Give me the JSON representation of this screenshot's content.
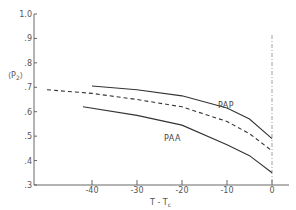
{
  "chart_data": {
    "type": "line",
    "title": "",
    "xlabel": "T - Tc",
    "ylabel": "⟨P2⟩",
    "xlim": [
      -50,
      3
    ],
    "ylim": [
      0.3,
      1.0
    ],
    "grid": false,
    "legend": "inline labels",
    "x_ticks": [
      "-40",
      "-30",
      "-20",
      "-10",
      "0"
    ],
    "y_ticks": [
      "1.0",
      ".9",
      ".8",
      ".7",
      ".6",
      ".5",
      ".4",
      ".3"
    ],
    "series": [
      {
        "name": "PAP",
        "style": "solid",
        "x": [
          -40,
          -30,
          -20,
          -10,
          -5,
          0
        ],
        "values": [
          0.705,
          0.69,
          0.665,
          0.615,
          0.57,
          0.49
        ]
      },
      {
        "name": "dashed",
        "style": "dashed",
        "x": [
          -50,
          -40,
          -30,
          -20,
          -10,
          -5,
          0
        ],
        "values": [
          0.69,
          0.675,
          0.65,
          0.62,
          0.56,
          0.51,
          0.44
        ]
      },
      {
        "name": "PAA",
        "style": "solid",
        "x": [
          -42,
          -30,
          -20,
          -10,
          -5,
          0
        ],
        "values": [
          0.62,
          0.585,
          0.545,
          0.465,
          0.42,
          0.35
        ]
      }
    ],
    "annotations": [
      {
        "type": "vertical dash-dot line",
        "x": 0
      }
    ]
  },
  "labels": {
    "ylabel_main": "⟨P",
    "ylabel_sub": "2",
    "ylabel_close": "⟩",
    "xlabel_main": "T - T",
    "xlabel_sub": "c",
    "pap": "PAP",
    "paa": "PAA"
  }
}
